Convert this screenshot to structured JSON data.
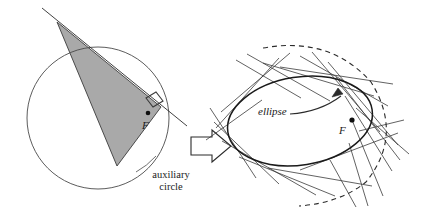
{
  "figure": {
    "type": "geometric-diagram",
    "background_color": "#ffffff",
    "stroke_color": "#2b2b2b",
    "triangle_fill_color": "#a9a9a9",
    "panels": [
      {
        "name": "auxiliary-circle-panel",
        "caption": {
          "line1": "auxiliary",
          "line2": "circle"
        },
        "focus_label": "F"
      },
      {
        "name": "ellipse-envelope-panel",
        "caption": "ellipse",
        "focus_label": "F"
      }
    ],
    "transition_arrow": "right-block-arrow"
  },
  "labels": {
    "auxiliary_line1": "auxiliary",
    "auxiliary_line2": "circle",
    "ellipse": "ellipse",
    "focus_left": "F",
    "focus_right": "F"
  },
  "geometry": {
    "circle": {
      "cx": 98,
      "cy": 118,
      "r": 71
    },
    "triangle": {
      "apex": [
        57,
        22
      ],
      "right": [
        161,
        107
      ],
      "bottom": [
        117,
        166
      ]
    },
    "ellipse": {
      "cx": 300,
      "cy": 121,
      "rx": 73,
      "ry": 44,
      "rotation_deg": -9
    },
    "focus_dot_left": [
      148,
      113
    ],
    "focus_dot_right": [
      352,
      120
    ]
  }
}
